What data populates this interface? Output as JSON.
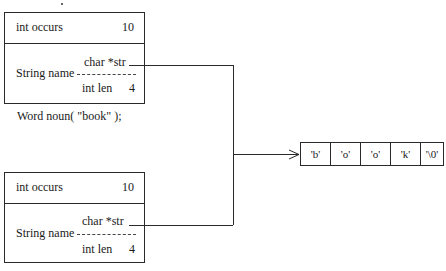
{
  "diagram": {
    "top_object": {
      "field_occurs_label": "int occurs",
      "field_occurs_value": "10",
      "string_label": "String name",
      "str_label": "char *str",
      "len_label": "int len",
      "len_value": "4"
    },
    "caption": "Word noun( \"book\" );",
    "bottom_object": {
      "field_occurs_label": "int occurs",
      "field_occurs_value": "10",
      "string_label": "String name",
      "str_label": "char *str",
      "len_label": "int len",
      "len_value": "4"
    },
    "char_array": {
      "cells": [
        "'b'",
        "'o'",
        "'o'",
        "'k'",
        "'\\0'"
      ]
    },
    "colors": {
      "line": "#2a2a2a",
      "background": "#ffffff"
    }
  }
}
